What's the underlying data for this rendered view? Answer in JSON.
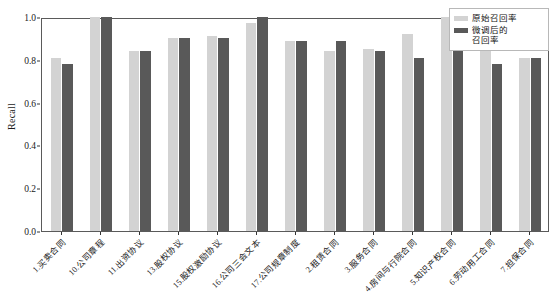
{
  "chart_data": {
    "type": "bar",
    "title": "",
    "xlabel": "",
    "ylabel": "Recall",
    "ylim": [
      0.0,
      1.0
    ],
    "yticks": [
      "0.0",
      "0.2",
      "0.4",
      "0.6",
      "0.8",
      "1.0"
    ],
    "ytick_values": [
      0.0,
      0.2,
      0.4,
      0.6,
      0.8,
      1.0
    ],
    "grid": false,
    "legend_position": "upper right",
    "categories": [
      "1.买卖合同",
      "10.公司章程",
      "11.出资协议",
      "13.股权协议",
      "15.股权激励协议",
      "16.公司三会文本",
      "17.公司规章制度",
      "2.租赁合同",
      "3.服务合同",
      "4.房间与行院合同",
      "5.知识产权合同",
      "6.劳动用工合同",
      "7.担保合同"
    ],
    "series": [
      {
        "name": "原始召回率",
        "color": "#d3d3d3",
        "values": [
          0.81,
          1.0,
          0.84,
          0.9,
          0.91,
          0.97,
          0.89,
          0.84,
          0.85,
          0.92,
          1.0,
          0.84,
          0.81
        ]
      },
      {
        "name": "微调后的召回率",
        "color": "#595959",
        "values": [
          0.78,
          1.0,
          0.84,
          0.9,
          0.9,
          1.0,
          0.89,
          0.89,
          0.84,
          0.81,
          1.0,
          0.78,
          0.81
        ]
      }
    ]
  },
  "legend": {
    "entries": [
      {
        "label": "原始召回率"
      },
      {
        "label": "微调后的\n召回率"
      }
    ]
  }
}
